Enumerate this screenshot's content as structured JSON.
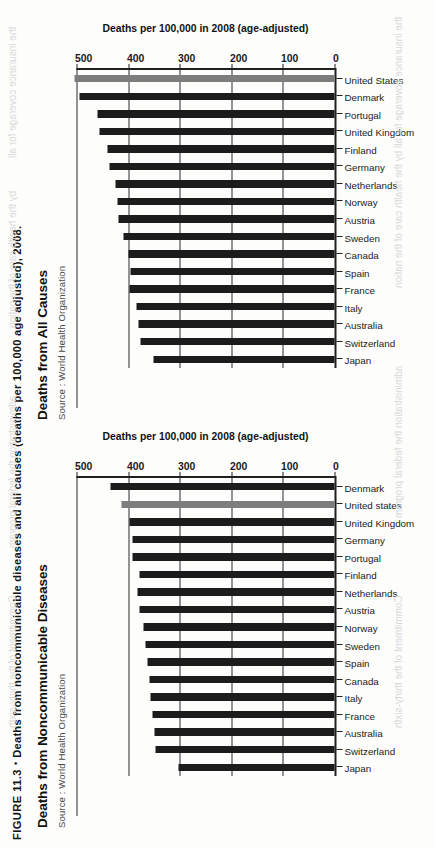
{
  "figure": {
    "number": "FIGURE 11.3",
    "bullet": "•",
    "caption": "Deaths from noncommunicable diseases and all causes (deaths per 100,000 age adjusted), 2008."
  },
  "chart_data": [
    {
      "id": "noncommunicable",
      "type": "bar",
      "title": "Deaths from Noncommunicable Diseases",
      "source": "Source : World Health Organization",
      "ylabel": "Deaths per 100,000 in 2008 (age-adjusted)",
      "xlabel": "",
      "ylim": [
        0,
        500
      ],
      "yticks": [
        0,
        100,
        200,
        300,
        400,
        500
      ],
      "grid": true,
      "legend": "none",
      "highlight_category": "United states",
      "highlight_color": "#7d7d7d",
      "bar_color": "#1c1c1c",
      "categories": [
        "Japan",
        "Switzerland",
        "Australia",
        "France",
        "Italy",
        "Canada",
        "Spain",
        "Sweden",
        "Norway",
        "Austria",
        "Netherlands",
        "Finland",
        "Portugal",
        "Germany",
        "United Kingdom",
        "United states",
        "Denmark"
      ],
      "values": [
        302,
        347,
        348,
        352,
        356,
        358,
        362,
        366,
        370,
        378,
        382,
        378,
        392,
        392,
        398,
        412,
        434
      ]
    },
    {
      "id": "all-causes",
      "type": "bar",
      "title": "Deaths from All Causes",
      "source": "Source : World Health Organization",
      "ylabel": "Deaths per 100,000 in 2008 (age-adjusted)",
      "xlabel": "",
      "ylim": [
        0,
        500
      ],
      "yticks": [
        0,
        100,
        200,
        300,
        400,
        500
      ],
      "grid": true,
      "legend": "none",
      "highlight_category": "United States",
      "highlight_color": "#7d7d7d",
      "bar_color": "#1c1c1c",
      "categories": [
        "Japan",
        "Switzerland",
        "Australia",
        "Italy",
        "France",
        "Spain",
        "Canada",
        "Sweden",
        "Austria",
        "Norway",
        "Netherlands",
        "Germany",
        "Finland",
        "United Kingdom",
        "Portugal",
        "Denmark",
        "United States"
      ],
      "values": [
        351,
        376,
        379,
        384,
        397,
        396,
        400,
        408,
        418,
        421,
        425,
        437,
        440,
        456,
        460,
        494,
        504
      ]
    }
  ],
  "bleed_text": [
    "Commitment of the thirty-sixth",
    "administration the federal program",
    "by the health care of the nation",
    "the insurance coverage for all"
  ]
}
